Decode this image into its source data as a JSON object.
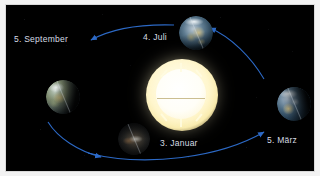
{
  "figure": {
    "background_color": "#000000",
    "border_color": "#d9d9d9",
    "arrow_color": "#2f6fd0",
    "label_color": "#d7dde4"
  },
  "sun": {
    "name": "Sonne",
    "cx": 175,
    "cy": 90,
    "radius": 26,
    "color": "#fff6cf"
  },
  "positions": [
    {
      "id": "september",
      "label": "5. September",
      "label_x": 13,
      "label_y": 33,
      "earth_cx": 57,
      "earth_cy": 92,
      "earth_r": 17
    },
    {
      "id": "juli",
      "label": "4. Juli",
      "label_x": 142,
      "label_y": 31,
      "earth_cx": 190,
      "earth_cy": 28,
      "earth_r": 17
    },
    {
      "id": "maerz",
      "label": "5. März",
      "label_x": 266,
      "label_y": 134,
      "earth_cx": 288,
      "earth_cy": 99,
      "earth_r": 17
    },
    {
      "id": "januar",
      "label": "3. Januar",
      "label_x": 159,
      "label_y": 137,
      "earth_cx": 128,
      "earth_cy": 134,
      "earth_r": 16
    }
  ],
  "arrows": [
    {
      "id": "arrow-to-september",
      "from": "4. Juli",
      "to": "5. September"
    },
    {
      "id": "arrow-to-januar",
      "from": "5. September",
      "to": "3. Januar"
    },
    {
      "id": "arrow-to-maerz",
      "from": "3. Januar",
      "to": "5. März"
    },
    {
      "id": "arrow-to-juli",
      "from": "5. März",
      "to": "4. Juli"
    }
  ]
}
